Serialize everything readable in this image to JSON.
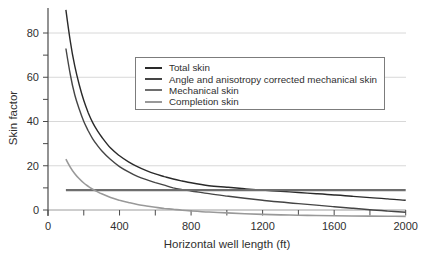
{
  "figure": {
    "background": "#ffffff"
  },
  "chart_data": {
    "type": "line",
    "title": "",
    "xlabel": "Horizontal well length (ft)",
    "ylabel": "Skin factor",
    "xlim": [
      0,
      2000
    ],
    "ylim": [
      -3,
      91
    ],
    "x_ticks_major": [
      0,
      400,
      800,
      1200,
      1600,
      2000
    ],
    "x_tick_labels": [
      "0",
      "400",
      "800",
      "1200",
      "1600",
      "2000"
    ],
    "x_ticks_minor": [
      200,
      600,
      1000,
      1400,
      1800
    ],
    "y_ticks_major": [
      0,
      20,
      40,
      60,
      80
    ],
    "y_tick_labels": [
      "0",
      "20",
      "40",
      "60",
      "80"
    ],
    "y_ticks_minor": [
      10,
      30,
      50,
      70
    ],
    "grid": "horizontal-major",
    "legend_position": "upper-center",
    "x": [
      100,
      125,
      150,
      175,
      200,
      225,
      250,
      275,
      300,
      350,
      400,
      450,
      500,
      550,
      600,
      650,
      700,
      750,
      800,
      900,
      1000,
      1100,
      1200,
      1300,
      1400,
      1500,
      1600,
      1700,
      1800,
      1900,
      2000
    ],
    "series": [
      {
        "name": "Total skin",
        "color": "#2a2a2a",
        "width": 1.4,
        "values": [
          90.5,
          76,
          65,
          56.5,
          49.5,
          44,
          39.5,
          36,
          33,
          28,
          24.5,
          21.8,
          19.6,
          17.8,
          16.3,
          15.1,
          14,
          13.1,
          12.3,
          11,
          10.3,
          9.6,
          9,
          8.45,
          7.9,
          7.35,
          6.8,
          6.2,
          5.6,
          5,
          4.4
        ]
      },
      {
        "name": "Angle and anisotropy corrected mechanical skin",
        "color": "#454545",
        "width": 1.4,
        "values": [
          73,
          61,
          52,
          45.5,
          40,
          35.8,
          32.2,
          29.3,
          26.8,
          22.8,
          19.6,
          17.2,
          15.2,
          13.7,
          12.4,
          11.2,
          10,
          9.2,
          8.6,
          7.4,
          6.3,
          5.3,
          4.4,
          3.6,
          2.9,
          2.2,
          1.5,
          0.8,
          0.1,
          -0.5,
          -1
        ]
      },
      {
        "name": "Mechanical skin",
        "color": "#6e6e6e",
        "width": 2.2,
        "values": [
          9,
          9,
          9,
          9,
          9,
          9,
          9,
          9,
          9,
          9,
          9,
          9,
          9,
          9,
          9,
          9,
          9,
          9,
          9,
          9,
          9,
          9,
          9,
          9,
          9,
          9,
          9,
          9,
          9,
          9,
          9
        ]
      },
      {
        "name": "Completion skin",
        "color": "#999999",
        "width": 1.6,
        "values": [
          23,
          19.3,
          16.4,
          14.1,
          12.2,
          10.7,
          9.4,
          8.3,
          7.3,
          5.7,
          4.4,
          3.4,
          2.5,
          1.8,
          1.2,
          0.7,
          0.3,
          -0.1,
          -0.4,
          -0.9,
          -1.3,
          -1.7,
          -2,
          -2.2,
          -2.35,
          -2.5,
          -2.6,
          -2.7,
          -2.75,
          -2.8,
          -2.9
        ]
      }
    ]
  },
  "colors": {
    "grid": "#d8d8d8",
    "axis": "#4a4a4a",
    "zero_line": "#9c9c9c",
    "text": "#2f2f2f",
    "legend_border": "#7c7c7c"
  }
}
